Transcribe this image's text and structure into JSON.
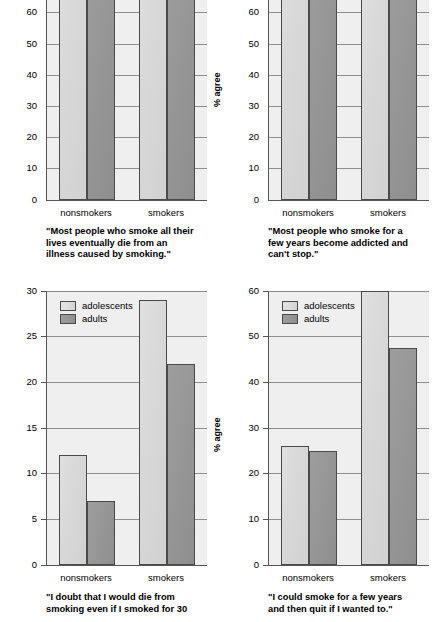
{
  "figure": {
    "ylabel": "% agree",
    "series_names": [
      "adolescents",
      "adults"
    ],
    "group_labels": [
      "nonsmokers",
      "smokers"
    ],
    "colors": {
      "adolescents": "#d8d8d8",
      "adults": "#969696",
      "axis": "#555555",
      "grid": "#8d8d8d",
      "plot_bg": "#efefef"
    }
  },
  "legend": {
    "adolescents": "adolescents",
    "adults": "adults"
  },
  "chart_data": [
    {
      "id": "top-left",
      "type": "bar",
      "title": "\"Most people who smoke all their lives eventually die from an illness caused by smoking.\"",
      "caption_lines": [
        "\"Most people who smoke all their",
        "lives eventually die from an",
        "illness caused by smoking.\""
      ],
      "xlabel": "",
      "ylabel": "% agree",
      "categories": [
        "nonsmokers",
        "smokers"
      ],
      "series": [
        {
          "name": "adolescents",
          "values": [
            88,
            86
          ]
        },
        {
          "name": "adults",
          "values": [
            90,
            89
          ]
        }
      ],
      "ylim": [
        0,
        75
      ],
      "yticks": [
        0,
        10,
        20,
        30,
        40,
        50,
        60,
        70
      ],
      "ytick_labels": [
        "0",
        "10",
        "20",
        "30",
        "40",
        "50",
        "60",
        "70"
      ],
      "grid": true,
      "note": "bars exceed the visible top of the cropped figure"
    },
    {
      "id": "top-right",
      "type": "bar",
      "title": "\"Most people who smoke for a few years become addicted and can't stop.\"",
      "caption_lines": [
        "\"Most people who smoke for a",
        "few years become addicted and",
        "can't stop.\""
      ],
      "xlabel": "",
      "ylabel": "% agree",
      "categories": [
        "nonsmokers",
        "smokers"
      ],
      "series": [
        {
          "name": "adolescents",
          "values": [
            87,
            71
          ]
        },
        {
          "name": "adults",
          "values": [
            89,
            83
          ]
        }
      ],
      "ylim": [
        0,
        75
      ],
      "yticks": [
        0,
        10,
        20,
        30,
        40,
        50,
        60,
        70
      ],
      "ytick_labels": [
        "0",
        "10",
        "20",
        "30",
        "40",
        "50",
        "60",
        "70"
      ],
      "grid": true,
      "note": "nonsmokers bars and smokers adults bar exceed the visible top"
    },
    {
      "id": "bottom-left",
      "type": "bar",
      "title": "\"I doubt that I would die from smoking even if I smoked for 30 years.\"",
      "caption_lines": [
        "\"I doubt that I would die from",
        "smoking even if I smoked for 30"
      ],
      "xlabel": "",
      "ylabel": "% agree",
      "categories": [
        "nonsmokers",
        "smokers"
      ],
      "series": [
        {
          "name": "adolescents",
          "values": [
            12,
            29
          ]
        },
        {
          "name": "adults",
          "values": [
            7,
            22
          ]
        }
      ],
      "ylim": [
        0,
        30
      ],
      "yticks": [
        0,
        5,
        10,
        15,
        20,
        25,
        30
      ],
      "ytick_labels": [
        "0",
        "5",
        "10",
        "15",
        "20",
        "25",
        "30"
      ],
      "grid": true,
      "legend_position": "top-left inside axes"
    },
    {
      "id": "bottom-right",
      "type": "bar",
      "title": "\"I could smoke for a few years and then quit if I wanted to.\"",
      "caption_lines": [
        "\"I could smoke for a few years",
        "and then quit if I wanted to.\""
      ],
      "xlabel": "",
      "ylabel": "% agree",
      "categories": [
        "nonsmokers",
        "smokers"
      ],
      "series": [
        {
          "name": "adolescents",
          "values": [
            26,
            60
          ]
        },
        {
          "name": "adults",
          "values": [
            25,
            47.5
          ]
        }
      ],
      "ylim": [
        0,
        60
      ],
      "yticks": [
        0,
        10,
        20,
        30,
        40,
        50,
        60
      ],
      "ytick_labels": [
        "0",
        "10",
        "20",
        "30",
        "40",
        "50",
        "60"
      ],
      "grid": true,
      "legend_position": "top-left inside axes"
    }
  ]
}
